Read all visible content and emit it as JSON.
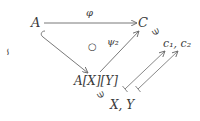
{
  "diagram": {
    "nodes": {
      "A": {
        "label": "A"
      },
      "C": {
        "label": "C"
      },
      "AXY": {
        "label": "A[X][Y]"
      },
      "c12": {
        "label": "c₁, c₂"
      },
      "XY": {
        "label": "X, Y"
      }
    },
    "edges": {
      "phi": {
        "from": "A",
        "to": "C",
        "label": "φ",
        "style": "arrow"
      },
      "inclusion": {
        "from": "A",
        "to": "A[X][Y]",
        "label": "",
        "style": "hook-arrow"
      },
      "psi2": {
        "from": "A[X][Y]",
        "to": "C",
        "label": "ψ₂",
        "style": "arrow"
      },
      "mapsto1": {
        "from": "X",
        "to": "c₁",
        "label": "",
        "style": "mapsto"
      },
      "mapsto2": {
        "from": "Y",
        "to": "c₂",
        "label": "",
        "style": "mapsto"
      }
    },
    "symbols": {
      "commute": "○",
      "ni_C": "∋",
      "ni_AXY": "∋",
      "rotated_left": "∽"
    },
    "colors": {
      "ink": "#3a3a3a",
      "line": "#6a6a6a"
    }
  }
}
